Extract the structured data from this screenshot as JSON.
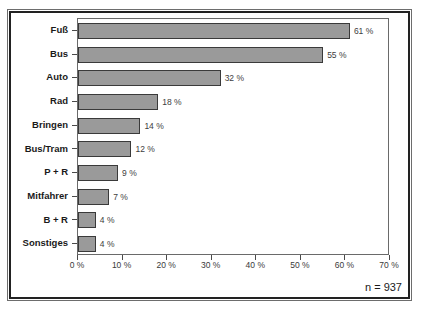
{
  "chart_data": {
    "type": "bar",
    "orientation": "horizontal",
    "title": "",
    "xlabel": "",
    "ylabel": "",
    "categories": [
      "Fuß",
      "Bus",
      "Auto",
      "Rad",
      "Bringen",
      "Bus/Tram",
      "P + R",
      "Mitfahrer",
      "B + R",
      "Sonstiges"
    ],
    "values": [
      61,
      55,
      32,
      18,
      14,
      12,
      9,
      7,
      4,
      4
    ],
    "value_labels": [
      "61 %",
      "55 %",
      "32 %",
      "18 %",
      "14 %",
      "12 %",
      "9 %",
      "7 %",
      "4 %",
      "4 %"
    ],
    "xlim": [
      0,
      70
    ],
    "xticks": [
      0,
      10,
      20,
      30,
      40,
      50,
      60,
      70
    ],
    "xtick_labels": [
      "0 %",
      "10 %",
      "20 %",
      "30 %",
      "40 %",
      "50 %",
      "60 %",
      "70 %"
    ],
    "grid": false,
    "legend": null,
    "annotation": "n = 937",
    "bar_color": "#9a9a9a",
    "bar_edge_color": "#3a3a3a",
    "plot_background": "#ffffff"
  },
  "figure": {
    "note": "n = 937"
  }
}
